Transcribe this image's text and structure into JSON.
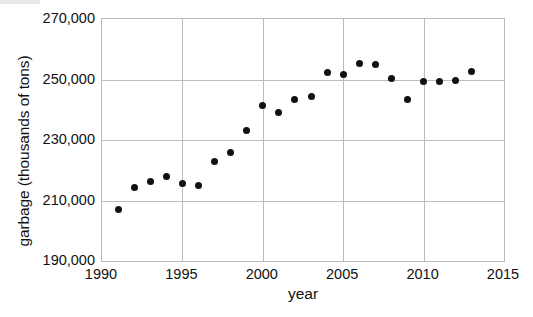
{
  "chart_data": {
    "type": "scatter",
    "title": "",
    "xlabel": "year",
    "ylabel": "garbage (thousands of tons)",
    "xlim": [
      1990,
      2015
    ],
    "ylim": [
      190000,
      270000
    ],
    "grid": true,
    "legend_position": "none",
    "x_ticks": [
      "1990",
      "1995",
      "2000",
      "2005",
      "2010",
      "2015"
    ],
    "x_tick_values": [
      1990,
      1995,
      2000,
      2005,
      2010,
      2015
    ],
    "y_ticks": [
      "190,000",
      "210,000",
      "230,000",
      "250,000",
      "270,000"
    ],
    "y_tick_values": [
      190000,
      210000,
      230000,
      250000,
      270000
    ],
    "marker": {
      "shape": "circle",
      "color": "#111111",
      "size_px": 7
    },
    "x": [
      1991,
      1992,
      1993,
      1994,
      1995,
      1996,
      1997,
      1998,
      1999,
      2000,
      2001,
      2002,
      2003,
      2004,
      2005,
      2006,
      2007,
      2008,
      2009,
      2010,
      2011,
      2012,
      2013
    ],
    "values": [
      207000,
      214200,
      216200,
      217800,
      215600,
      214900,
      222800,
      226000,
      233200,
      241400,
      239100,
      243400,
      244400,
      252200,
      251600,
      255200,
      254900,
      250300,
      243400,
      249400,
      249400,
      249700,
      252500
    ],
    "points": [
      {
        "year": 1991,
        "garbage": 207000
      },
      {
        "year": 1992,
        "garbage": 214200
      },
      {
        "year": 1993,
        "garbage": 216200
      },
      {
        "year": 1994,
        "garbage": 217800
      },
      {
        "year": 1995,
        "garbage": 215600
      },
      {
        "year": 1996,
        "garbage": 214900
      },
      {
        "year": 1997,
        "garbage": 222800
      },
      {
        "year": 1998,
        "garbage": 226000
      },
      {
        "year": 1999,
        "garbage": 233200
      },
      {
        "year": 2000,
        "garbage": 241400
      },
      {
        "year": 2001,
        "garbage": 239100
      },
      {
        "year": 2002,
        "garbage": 243400
      },
      {
        "year": 2003,
        "garbage": 244400
      },
      {
        "year": 2004,
        "garbage": 252200
      },
      {
        "year": 2005,
        "garbage": 251600
      },
      {
        "year": 2006,
        "garbage": 255200
      },
      {
        "year": 2007,
        "garbage": 254900
      },
      {
        "year": 2008,
        "garbage": 250300
      },
      {
        "year": 2009,
        "garbage": 243400
      },
      {
        "year": 2010,
        "garbage": 249400
      },
      {
        "year": 2011,
        "garbage": 249400
      },
      {
        "year": 2012,
        "garbage": 249700
      },
      {
        "year": 2013,
        "garbage": 252500
      }
    ]
  },
  "axes": {
    "y_title": "garbage (thousands of tons)",
    "x_title": "year"
  },
  "colors": {
    "marker": "#111111",
    "grid": "#bdbdbd",
    "frame": "#b9b9b9",
    "text": "#111111",
    "background": "#ffffff"
  }
}
